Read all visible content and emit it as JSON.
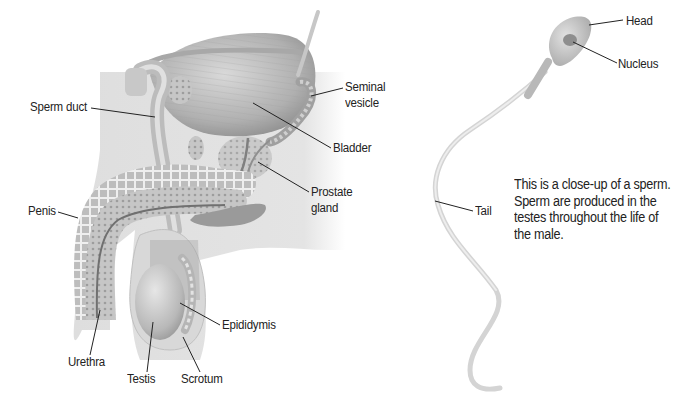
{
  "figure": {
    "left_panel": {
      "title": "Male reproductive system (cross-section)",
      "labels": {
        "sperm_duct": "Sperm duct",
        "seminal_vesicle_line1": "Seminal",
        "seminal_vesicle_line2": "vesicle",
        "bladder": "Bladder",
        "prostate_line1": "Prostate",
        "prostate_line2": "gland",
        "penis": "Penis",
        "epididymis": "Epididymis",
        "urethra": "Urethra",
        "testis": "Testis",
        "scrotum": "Scrotum"
      }
    },
    "right_panel": {
      "labels": {
        "head": "Head",
        "nucleus": "Nucleus",
        "tail": "Tail"
      },
      "caption": {
        "lines": [
          "This is a close-up of a sperm.",
          "Sperm are produced in the",
          "testes throughout the life of",
          "the male."
        ]
      }
    },
    "colors": {
      "background": "#ffffff",
      "body_silhouette": "#dcdcdc",
      "organ_light": "#cfcfcf",
      "organ_mid": "#b5b5b5",
      "organ_dark": "#8c8c8c",
      "leader_line": "#222222",
      "text": "#222222"
    }
  }
}
